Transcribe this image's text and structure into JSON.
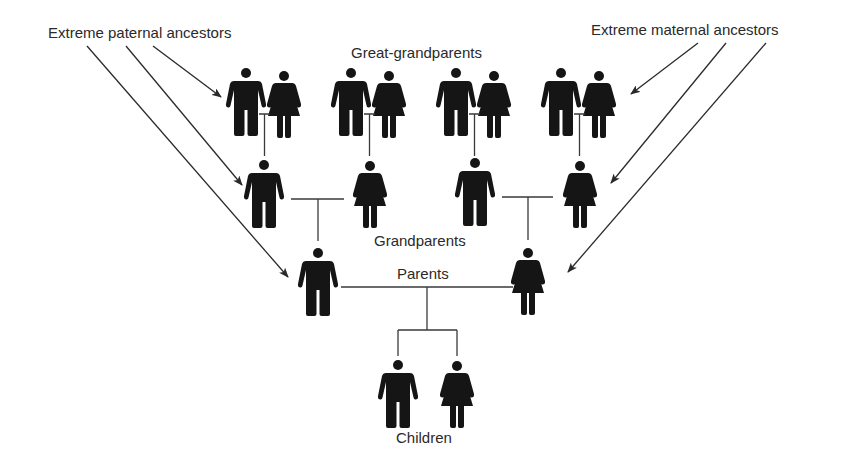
{
  "diagram": {
    "type": "family-tree",
    "labels": {
      "extreme_paternal": "Extreme paternal ancestors",
      "extreme_maternal": "Extreme maternal ancestors",
      "great_grandparents": "Great-grandparents",
      "grandparents": "Grandparents",
      "parents": "Parents",
      "children": "Children"
    },
    "generations": [
      {
        "name": "Great-grandparents",
        "members": [
          {
            "sex": "male"
          },
          {
            "sex": "female"
          },
          {
            "sex": "male"
          },
          {
            "sex": "female"
          },
          {
            "sex": "male"
          },
          {
            "sex": "female"
          },
          {
            "sex": "male"
          },
          {
            "sex": "female"
          }
        ]
      },
      {
        "name": "Grandparents",
        "members": [
          {
            "sex": "male"
          },
          {
            "sex": "female"
          },
          {
            "sex": "male"
          },
          {
            "sex": "female"
          }
        ]
      },
      {
        "name": "Parents",
        "members": [
          {
            "sex": "male"
          },
          {
            "sex": "female"
          }
        ]
      },
      {
        "name": "Children",
        "members": [
          {
            "sex": "male"
          },
          {
            "sex": "female"
          }
        ]
      }
    ],
    "arrows": {
      "paternal_targets": [
        "paternal great-grandfather",
        "paternal grandfather",
        "father"
      ],
      "maternal_targets": [
        "maternal great-grandmother",
        "maternal grandmother",
        "mother"
      ]
    },
    "colors": {
      "figure": "#151515",
      "line": "#3a3a3a",
      "text": "#2a2a2a",
      "background": "#ffffff"
    }
  }
}
